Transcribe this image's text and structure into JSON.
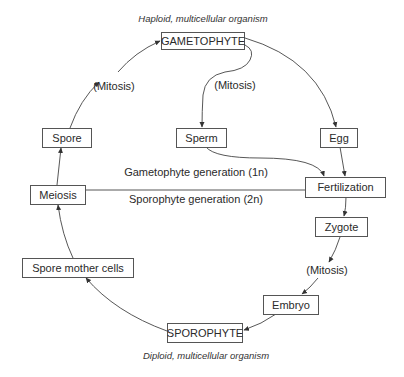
{
  "diagram": {
    "title_top": "Haploid, multicellular organism",
    "title_bottom": "Diploid, multicellular organism",
    "nodes": {
      "gametophyte": "GAMETOPHYTE",
      "spore": "Spore",
      "meiosis": "Meiosis",
      "sperm": "Sperm",
      "egg": "Egg",
      "fertilization": "Fertilization",
      "zygote": "Zygote",
      "spore_mother_cells": "Spore mother cells",
      "embryo": "Embryo",
      "sporophyte": "SPOROPHYTE"
    },
    "process_labels": {
      "mitosis_spore_to_gametophyte": "(Mitosis)",
      "mitosis_gametophyte_to_sperm": "(Mitosis)",
      "mitosis_zygote_to_embryo": "(Mitosis)"
    },
    "generation_labels": {
      "gametophyte_generation": "Gametophyte generation (1n)",
      "sporophyte_generation": "Sporophyte generation (2n)"
    },
    "edges": [
      {
        "from": "Spore",
        "to": "GAMETOPHYTE",
        "label": "(Mitosis)"
      },
      {
        "from": "GAMETOPHYTE",
        "to": "Sperm",
        "label": "(Mitosis)"
      },
      {
        "from": "GAMETOPHYTE",
        "to": "Egg"
      },
      {
        "from": "Sperm",
        "to": "Fertilization"
      },
      {
        "from": "Egg",
        "to": "Fertilization"
      },
      {
        "from": "Fertilization",
        "to": "Zygote"
      },
      {
        "from": "Zygote",
        "to": "Embryo",
        "label": "(Mitosis)"
      },
      {
        "from": "Embryo",
        "to": "SPOROPHYTE"
      },
      {
        "from": "SPOROPHYTE",
        "to": "Spore mother cells"
      },
      {
        "from": "Spore mother cells",
        "to": "Meiosis"
      },
      {
        "from": "Meiosis",
        "to": "Spore"
      }
    ],
    "colors": {
      "line": "#444444",
      "box_border": "#555555",
      "text": "#2a2a2a",
      "background": "#ffffff"
    }
  }
}
